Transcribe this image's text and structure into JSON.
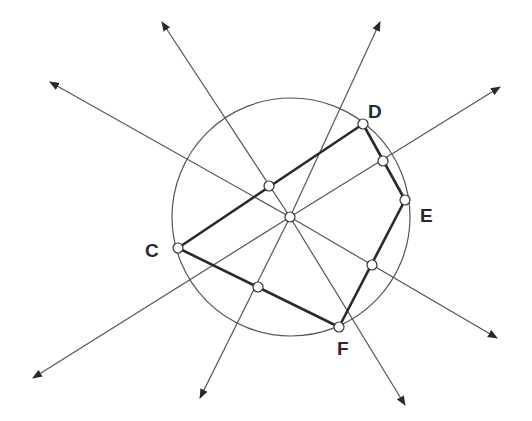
{
  "diagram": {
    "colors": {
      "stroke": "#555555",
      "polygon": "#2a2a2a",
      "point_fill": "#ffffff",
      "label": "#2a2a2a"
    },
    "circle": {
      "cx": 291,
      "cy": 217,
      "r": 119
    },
    "center": {
      "x": 290,
      "y": 217
    },
    "vertices": [
      {
        "id": "C",
        "x": 178,
        "y": 248,
        "label": "C",
        "lx": 145,
        "ly": 257
      },
      {
        "id": "D",
        "x": 363,
        "y": 124,
        "label": "D",
        "lx": 368,
        "ly": 118
      },
      {
        "id": "E",
        "x": 405,
        "y": 200,
        "label": "E",
        "lx": 420,
        "ly": 222
      },
      {
        "id": "F",
        "x": 339,
        "y": 327,
        "label": "F",
        "lx": 337,
        "ly": 355
      }
    ],
    "midpoints": [
      {
        "side": "CD",
        "x": 269,
        "y": 186
      },
      {
        "side": "DE",
        "x": 383,
        "y": 161
      },
      {
        "side": "EF",
        "x": 372,
        "y": 265
      },
      {
        "side": "CF",
        "x": 258,
        "y": 287
      }
    ],
    "rays": [
      {
        "name": "bisector-cd-up",
        "x1": 290,
        "y1": 217,
        "x2": 162,
        "y2": 22
      },
      {
        "name": "bisector-cd-down",
        "x1": 290,
        "y1": 217,
        "x2": 405,
        "y2": 405
      },
      {
        "name": "bisector-de-up",
        "x1": 290,
        "y1": 217,
        "x2": 500,
        "y2": 87
      },
      {
        "name": "bisector-de-down",
        "x1": 290,
        "y1": 217,
        "x2": 33,
        "y2": 378
      },
      {
        "name": "bisector-ef-up",
        "x1": 290,
        "y1": 217,
        "x2": 50,
        "y2": 82
      },
      {
        "name": "bisector-ef-down",
        "x1": 290,
        "y1": 217,
        "x2": 497,
        "y2": 338
      },
      {
        "name": "bisector-cf-up",
        "x1": 290,
        "y1": 217,
        "x2": 380,
        "y2": 22
      },
      {
        "name": "bisector-cf-down",
        "x1": 290,
        "y1": 217,
        "x2": 200,
        "y2": 398
      }
    ]
  }
}
